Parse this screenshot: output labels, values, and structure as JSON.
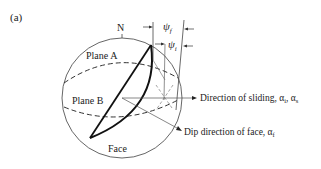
{
  "figure": {
    "panel_label": "(a)",
    "north_label": "N",
    "plane_a_label": "Plane A",
    "plane_b_label": "Plane B",
    "face_label": "Face",
    "psi_f_label": "ψ",
    "psi_f_sub": "f",
    "psi_i_label": "ψ",
    "psi_i_sub": "i",
    "sliding_label": "Direction of sliding, α",
    "sliding_sub1": "i",
    "sliding_sep": ", α",
    "sliding_sub2": "s",
    "dip_label": "Dip direction of face, α",
    "dip_sub": "f"
  }
}
